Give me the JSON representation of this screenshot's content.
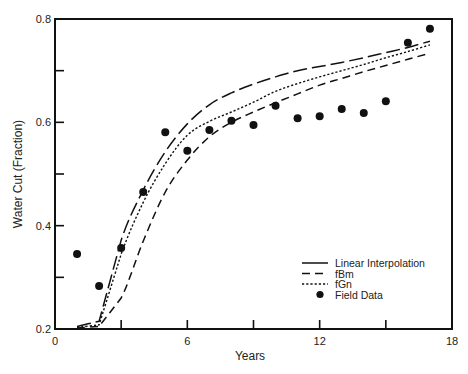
{
  "chart_data": {
    "type": "line",
    "title": "",
    "xlabel": "Years",
    "ylabel": "Water Cut (Fraction)",
    "xlim": [
      0,
      18
    ],
    "ylim": [
      0.2,
      0.8
    ],
    "xticks": [
      0,
      3,
      6,
      9,
      12,
      15,
      18
    ],
    "xtick_labels": [
      "0",
      "",
      "6",
      "",
      "12",
      "",
      "18"
    ],
    "yticks": [
      0.2,
      0.3,
      0.4,
      0.5,
      0.6,
      0.7,
      0.8
    ],
    "ytick_labels": [
      "0.2",
      "",
      "0.4",
      "",
      "0.6",
      "",
      "0.8"
    ],
    "grid": false,
    "legend_position": "lower right",
    "x": [
      1,
      2,
      3,
      4,
      5,
      6,
      7,
      8,
      9,
      10,
      11,
      12,
      13,
      14,
      15,
      16,
      17
    ],
    "series": [
      {
        "name": "Linear Interpolation",
        "style": "solid",
        "x": [
          1,
          2,
          3,
          4,
          5,
          6,
          7,
          8,
          9,
          10,
          11,
          12,
          13,
          14,
          15,
          16,
          17
        ],
        "values": [
          0.205,
          0.215,
          0.372,
          0.469,
          0.543,
          0.597,
          0.634,
          0.657,
          0.674,
          0.688,
          0.7,
          0.708,
          0.716,
          0.725,
          0.735,
          0.745,
          0.757
        ]
      },
      {
        "name": "fBm",
        "style": "dashed",
        "x": [
          1,
          2,
          3,
          4,
          5,
          6,
          7,
          8,
          9,
          10,
          11,
          12,
          13,
          14,
          15,
          16,
          17
        ],
        "values": [
          0.202,
          0.205,
          0.26,
          0.37,
          0.465,
          0.527,
          0.572,
          0.6,
          0.62,
          0.638,
          0.655,
          0.672,
          0.685,
          0.698,
          0.71,
          0.722,
          0.734
        ]
      },
      {
        "name": "fGn",
        "style": "dotted",
        "x": [
          1,
          2,
          3,
          4,
          5,
          6,
          7,
          8,
          9,
          10,
          11,
          12,
          13,
          14,
          15,
          16,
          17
        ],
        "values": [
          0.203,
          0.208,
          0.345,
          0.445,
          0.52,
          0.575,
          0.602,
          0.62,
          0.639,
          0.66,
          0.675,
          0.688,
          0.7,
          0.712,
          0.725,
          0.737,
          0.75
        ]
      },
      {
        "name": "Field Data",
        "style": "markers",
        "x": [
          1,
          2,
          3,
          4,
          5,
          6,
          7,
          8,
          9,
          10,
          11,
          12,
          13,
          14,
          15,
          16,
          17
        ],
        "values": [
          0.345,
          0.283,
          0.357,
          0.465,
          0.581,
          0.545,
          0.585,
          0.603,
          0.595,
          0.632,
          0.608,
          0.612,
          0.626,
          0.618,
          0.641,
          0.754,
          0.781
        ]
      }
    ]
  },
  "legend": {
    "items": [
      {
        "label": "Linear Interpolation",
        "symbol": "solid-line"
      },
      {
        "label": "fBm",
        "symbol": "dashed-line"
      },
      {
        "label": "fGn",
        "symbol": "dotted-line"
      },
      {
        "label": "Field Data",
        "symbol": "filled-circle"
      }
    ]
  },
  "colors": {
    "ink": "#111111",
    "background": "#ffffff"
  }
}
